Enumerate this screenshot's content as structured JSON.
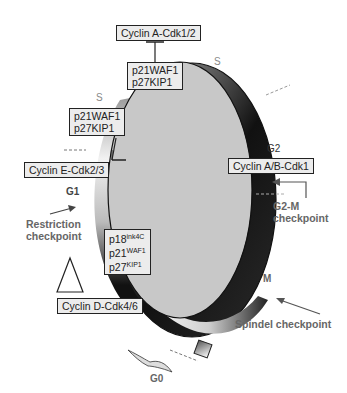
{
  "diagram": {
    "phases": {
      "s_left": "S",
      "s_right": "S",
      "g1": "G1",
      "g2": "G2",
      "m": "M",
      "g0": "G0"
    },
    "complexes": {
      "cyclin_a": "Cyclin A-Cdk1/2",
      "cyclin_e": "Cyclin E-Cdk2/3",
      "cyclin_ab": "Cyclin A/B-Cdk1",
      "cyclin_d": "Cyclin D-Cdk4/6"
    },
    "inhibitors": {
      "top": [
        "p21WAF1",
        "p27KIP1"
      ],
      "left": [
        "p21WAF1",
        "p27KIP1"
      ],
      "g1": [
        {
          "base": "p18",
          "sup": "ink4C"
        },
        {
          "base": "p21",
          "sup": "WAF1"
        },
        {
          "base": "p27",
          "sup": "KIP1"
        }
      ]
    },
    "checkpoints": {
      "restriction": [
        "Restriction",
        "checkpoint"
      ],
      "g2m": [
        "G2-M",
        "checkpoint"
      ],
      "spindel": "Spindel checkpoint"
    },
    "colors": {
      "inner_fill": "#c8c8c8",
      "ring_dark": "#111111",
      "box_fill": "#ececec",
      "label_gray": "#666666"
    }
  }
}
